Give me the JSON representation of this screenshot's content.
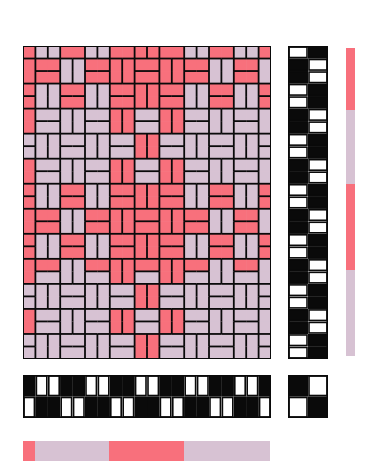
{
  "figure": {
    "kind": "weaving-draft"
  },
  "colors": {
    "pink": "#f8707c",
    "lilac": "#d7c2d3",
    "ink": "#0a0a0a",
    "paper": "#ffffff"
  },
  "threading": {
    "columns": 20,
    "rows": 2,
    "shaft_per_column": [
      2,
      1,
      1,
      2,
      2,
      1,
      1,
      2,
      2,
      1,
      1,
      2,
      2,
      1,
      1,
      2,
      2,
      1,
      1,
      2
    ]
  },
  "treadling": {
    "rows": 25,
    "columns": 2,
    "treadle_per_pick": [
      2,
      1,
      1,
      2,
      2,
      1,
      1,
      2,
      2,
      1,
      1,
      2,
      2,
      1,
      1,
      2,
      2,
      1,
      1,
      2,
      2,
      1,
      1,
      2,
      2
    ]
  },
  "tieup": {
    "cells": [
      [
        1,
        0
      ],
      [
        0,
        1
      ]
    ]
  },
  "warp_color_order": [
    {
      "color": "pink",
      "from": 0,
      "to": 1
    },
    {
      "color": "lilac",
      "from": 1,
      "to": 7
    },
    {
      "color": "pink",
      "from": 7,
      "to": 13
    },
    {
      "color": "lilac",
      "from": 13,
      "to": 20
    }
  ],
  "weft_color_order": [
    {
      "color": "pink",
      "from": 0,
      "to": 5
    },
    {
      "color": "lilac",
      "from": 5,
      "to": 11
    },
    {
      "color": "pink",
      "from": 11,
      "to": 18
    },
    {
      "color": "lilac",
      "from": 18,
      "to": 25
    }
  ]
}
